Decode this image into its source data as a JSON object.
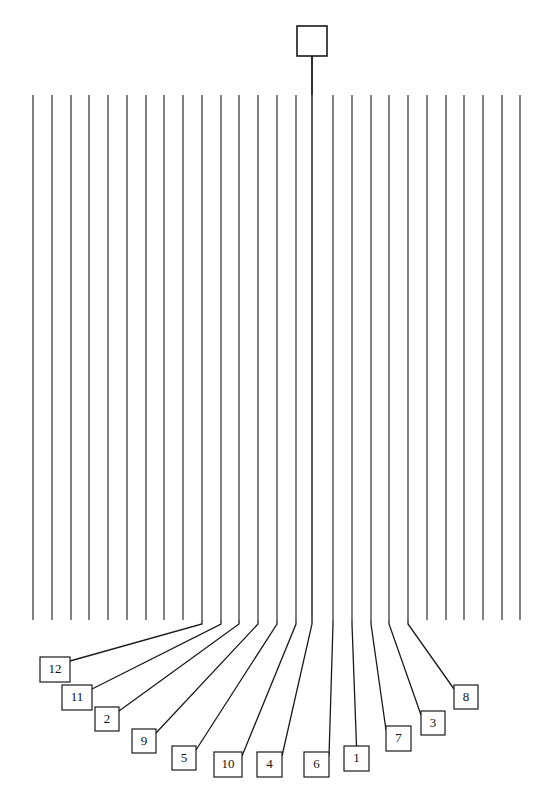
{
  "figure": {
    "title": "",
    "type": "dendrogram-tree",
    "background_color": "#ffffff",
    "line_color": "#1a1a1a",
    "width": 553,
    "height": 803
  },
  "root_node": {
    "name": "root-box",
    "label": "",
    "x": 297,
    "y": 26,
    "width": 30,
    "height": 30,
    "stem_x": 312,
    "stem_top": 56,
    "stem_bottom": 620
  },
  "trunk": {
    "top_y": 95,
    "bottom_y": 620,
    "line_count": 27,
    "first_x": 33,
    "spacing": 18.7
  },
  "branches": [
    {
      "x": 33,
      "labeled": false
    },
    {
      "x": 52,
      "labeled": false
    },
    {
      "x": 71,
      "labeled": false
    },
    {
      "x": 89,
      "labeled": false
    },
    {
      "x": 108,
      "labeled": false
    },
    {
      "x": 127,
      "labeled": false
    },
    {
      "x": 146,
      "labeled": false
    },
    {
      "x": 164,
      "labeled": false
    },
    {
      "x": 183,
      "labeled": false
    },
    {
      "x": 202,
      "labeled": true,
      "label": "12"
    },
    {
      "x": 221,
      "labeled": true,
      "label": "11"
    },
    {
      "x": 239,
      "labeled": true,
      "label": "2"
    },
    {
      "x": 258,
      "labeled": true,
      "label": "9"
    },
    {
      "x": 277,
      "labeled": true,
      "label": "5"
    },
    {
      "x": 296,
      "labeled": true,
      "label": "10"
    },
    {
      "x": 312,
      "labeled": true,
      "label": "4"
    },
    {
      "x": 333,
      "labeled": true,
      "label": "6"
    },
    {
      "x": 352,
      "labeled": true,
      "label": "1"
    },
    {
      "x": 371,
      "labeled": true,
      "label": "7"
    },
    {
      "x": 389,
      "labeled": true,
      "label": "3"
    },
    {
      "x": 408,
      "labeled": true,
      "label": "8"
    },
    {
      "x": 427,
      "labeled": false
    },
    {
      "x": 446,
      "labeled": false
    },
    {
      "x": 464,
      "labeled": false
    },
    {
      "x": 483,
      "labeled": false
    },
    {
      "x": 502,
      "labeled": false
    },
    {
      "x": 520,
      "labeled": false
    }
  ],
  "labels": [
    {
      "id": "label-12",
      "text": "12",
      "x": 40,
      "y": 657,
      "width": 30,
      "height": 25,
      "anchor_x": 202,
      "anchor_y": 620
    },
    {
      "id": "label-11",
      "text": "11",
      "x": 62,
      "y": 685,
      "width": 30,
      "height": 25,
      "anchor_x": 221,
      "anchor_y": 620
    },
    {
      "id": "label-2",
      "text": "2",
      "x": 95,
      "y": 707,
      "width": 24,
      "height": 24,
      "anchor_x": 239,
      "anchor_y": 620
    },
    {
      "id": "label-9",
      "text": "9",
      "x": 132,
      "y": 729,
      "width": 24,
      "height": 24,
      "anchor_x": 258,
      "anchor_y": 620
    },
    {
      "id": "label-5",
      "text": "5",
      "x": 172,
      "y": 746,
      "width": 24,
      "height": 24,
      "anchor_x": 277,
      "anchor_y": 620
    },
    {
      "id": "label-10",
      "text": "10",
      "x": 214,
      "y": 752,
      "width": 28,
      "height": 25,
      "anchor_x": 296,
      "anchor_y": 620
    },
    {
      "id": "label-4",
      "text": "4",
      "x": 257,
      "y": 752,
      "width": 25,
      "height": 25,
      "anchor_x": 312,
      "anchor_y": 620
    },
    {
      "id": "label-6",
      "text": "6",
      "x": 304,
      "y": 752,
      "width": 25,
      "height": 25,
      "anchor_x": 333,
      "anchor_y": 620
    },
    {
      "id": "label-1",
      "text": "1",
      "x": 344,
      "y": 746,
      "width": 25,
      "height": 25,
      "anchor_x": 352,
      "anchor_y": 620
    },
    {
      "id": "label-7",
      "text": "7",
      "x": 386,
      "y": 726,
      "width": 25,
      "height": 25,
      "anchor_x": 371,
      "anchor_y": 620
    },
    {
      "id": "label-3",
      "text": "3",
      "x": 421,
      "y": 711,
      "width": 24,
      "height": 24,
      "anchor_x": 389,
      "anchor_y": 620
    },
    {
      "id": "label-8",
      "text": "8",
      "x": 454,
      "y": 685,
      "width": 24,
      "height": 24,
      "anchor_x": 408,
      "anchor_y": 620
    }
  ]
}
